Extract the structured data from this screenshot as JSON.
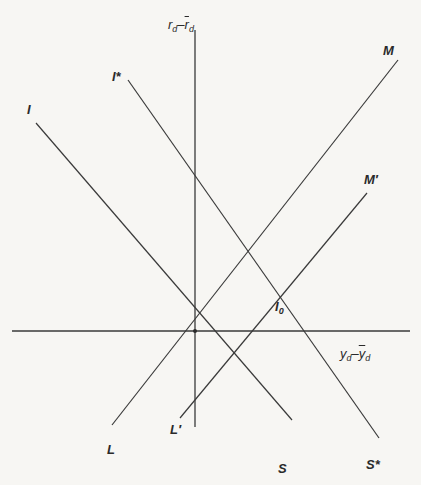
{
  "diagram": {
    "colors": {
      "background": "#f7f6f3",
      "line": "#3a3a3a"
    },
    "axes": {
      "vertical_label": {
        "main": "r",
        "sub": "d",
        "sep": "–",
        "main2": "r",
        "sub2": "d"
      },
      "horizontal_label": {
        "main": "y",
        "sub": "d",
        "sep": "–",
        "main2": "y",
        "sub2": "d"
      }
    },
    "curves": {
      "I_S": {
        "top_label": "I",
        "bottom_label": "S"
      },
      "Istar_Sstar": {
        "top_label": "I*",
        "bottom_label": "S*"
      },
      "L_M": {
        "top_label": "M",
        "bottom_label": "L"
      },
      "Lp_Mp": {
        "top_label": "M′",
        "bottom_label": "L′"
      }
    },
    "points": {
      "equilibrium": "I",
      "equilibrium_sub": "0"
    }
  }
}
